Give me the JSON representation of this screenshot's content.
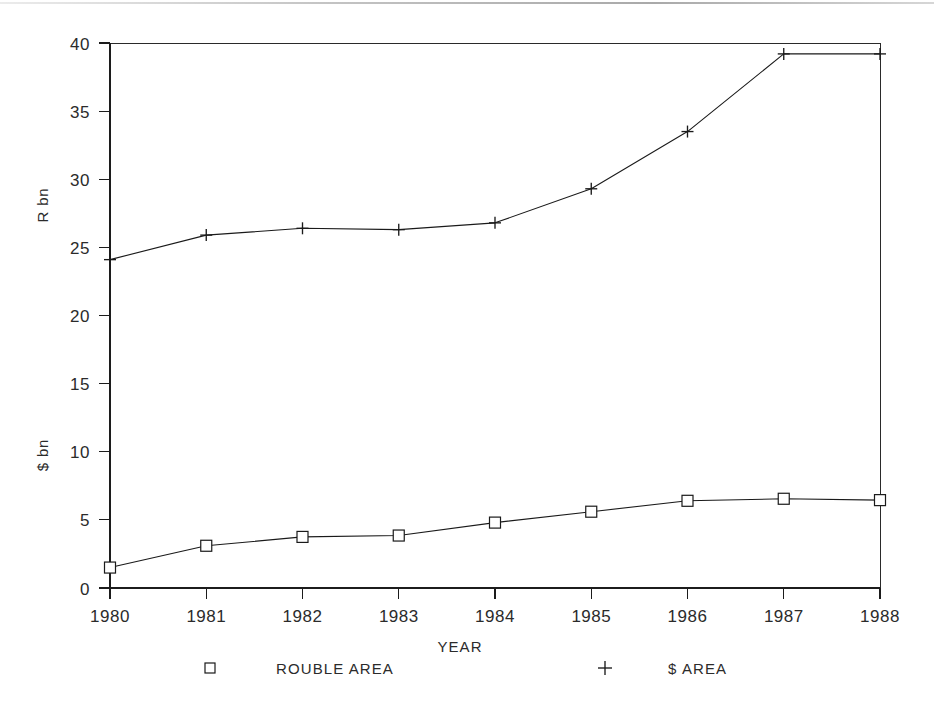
{
  "chart_data": {
    "type": "line",
    "title": "",
    "subtitle": "",
    "xlabel": "YEAR",
    "ylabel_left_upper": "R bn",
    "ylabel_left_lower": "$ bn",
    "x": [
      1980,
      1981,
      1982,
      1983,
      1984,
      1985,
      1986,
      1987,
      1988
    ],
    "categories": [
      "1980",
      "1981",
      "1982",
      "1983",
      "1984",
      "1985",
      "1986",
      "1987",
      "1988"
    ],
    "xlim": [
      1980,
      1988
    ],
    "ylim": [
      0,
      40
    ],
    "yticks": [
      0,
      5,
      10,
      15,
      20,
      25,
      30,
      35,
      40
    ],
    "ytick_labels": [
      "0",
      "5",
      "10",
      "15",
      "20",
      "25",
      "30",
      "35",
      "40"
    ],
    "xticks": [
      1980,
      1981,
      1982,
      1983,
      1984,
      1985,
      1986,
      1987,
      1988
    ],
    "grid": false,
    "legend_position": "bottom",
    "series": [
      {
        "name": "ROUBLE AREA",
        "marker": "square",
        "unit": "$ bn",
        "values": [
          1.5,
          3.1,
          3.75,
          3.85,
          4.8,
          5.6,
          6.4,
          6.55,
          6.45
        ]
      },
      {
        "name": "$ AREA",
        "marker": "plus",
        "unit": "R bn",
        "values": [
          24.1,
          25.9,
          26.4,
          26.3,
          26.8,
          29.3,
          33.5,
          39.2,
          39.2
        ]
      }
    ]
  },
  "axes": {
    "y_title_upper": "R bn",
    "y_title_lower": "$ bn",
    "x_title": "YEAR"
  },
  "legend": {
    "entries": [
      {
        "marker_icon": "square-marker-icon",
        "label": "ROUBLE AREA"
      },
      {
        "marker_icon": "plus-marker-icon",
        "label": "$ AREA"
      }
    ]
  },
  "ticks": {
    "y": [
      "0",
      "5",
      "10",
      "15",
      "20",
      "25",
      "30",
      "35",
      "40"
    ],
    "x": [
      "1980",
      "1981",
      "1982",
      "1983",
      "1984",
      "1985",
      "1986",
      "1987",
      "1988"
    ]
  },
  "colors": {
    "ink": "#1a1a1a",
    "background": "#ffffff",
    "scanline": "#b9b9b9"
  }
}
